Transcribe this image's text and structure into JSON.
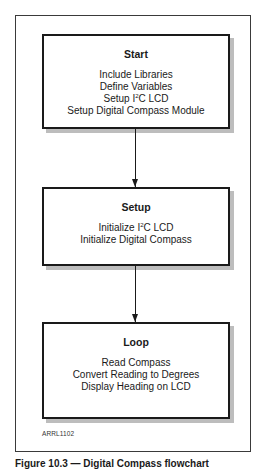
{
  "diagram": {
    "type": "flowchart",
    "boxes": [
      {
        "id": "start",
        "title": "Start",
        "lines": [
          {
            "pre": "Include Libraries",
            "sup": "",
            "post": ""
          },
          {
            "pre": "Define Variables",
            "sup": "",
            "post": ""
          },
          {
            "pre": "Setup I",
            "sup": "2",
            "post": "C LCD"
          },
          {
            "pre": "Setup Digital Compass Module",
            "sup": "",
            "post": ""
          }
        ]
      },
      {
        "id": "setup",
        "title": "Setup",
        "lines": [
          {
            "pre": "Initialize I",
            "sup": "2",
            "post": "C LCD"
          },
          {
            "pre": "Initialize Digital Compass",
            "sup": "",
            "post": ""
          }
        ]
      },
      {
        "id": "loop",
        "title": "Loop",
        "lines": [
          {
            "pre": "Read Compass",
            "sup": "",
            "post": ""
          },
          {
            "pre": "Convert Reading to Degrees",
            "sup": "",
            "post": ""
          },
          {
            "pre": "Display Heading on LCD",
            "sup": "",
            "post": ""
          }
        ]
      }
    ],
    "edges": [
      {
        "from": "start",
        "to": "setup"
      },
      {
        "from": "setup",
        "to": "loop"
      }
    ],
    "figure_id": "ARRL1102",
    "caption": "Figure 10.3 — Digital Compass flowchart"
  },
  "colors": {
    "border": "#1a1a1a",
    "shadow": "#bdbdbd",
    "background": "#ffffff"
  }
}
